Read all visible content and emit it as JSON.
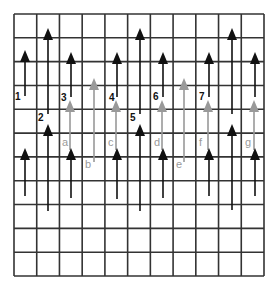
{
  "figure": {
    "colors": {
      "background": "#ffffff",
      "grid": "#333333",
      "black_arrow": "#111111",
      "gray_arrow": "#999999",
      "number_label": "#111111",
      "letter_label": "#9a9a9a"
    },
    "grid": {
      "left": 14,
      "top": 14,
      "right": 264,
      "bottom": 276,
      "columns": 11,
      "rows": 11
    },
    "black_arrows": [
      {
        "x": 25,
        "tip": 50,
        "tail": 96
      },
      {
        "x": 48,
        "tip": 28,
        "tail": 114
      },
      {
        "x": 71,
        "tip": 52,
        "tail": 97
      },
      {
        "x": 117,
        "tip": 52,
        "tail": 97
      },
      {
        "x": 140,
        "tip": 28,
        "tail": 114
      },
      {
        "x": 163,
        "tip": 52,
        "tail": 97
      },
      {
        "x": 209,
        "tip": 52,
        "tail": 97
      },
      {
        "x": 232,
        "tip": 28,
        "tail": 114
      },
      {
        "x": 255,
        "tip": 52,
        "tail": 97
      },
      {
        "x": 25,
        "tip": 148,
        "tail": 196
      },
      {
        "x": 48,
        "tip": 124,
        "tail": 211
      },
      {
        "x": 71,
        "tip": 148,
        "tail": 198
      },
      {
        "x": 117,
        "tip": 148,
        "tail": 199
      },
      {
        "x": 140,
        "tip": 124,
        "tail": 211
      },
      {
        "x": 163,
        "tip": 148,
        "tail": 198
      },
      {
        "x": 209,
        "tip": 148,
        "tail": 196
      },
      {
        "x": 232,
        "tip": 124,
        "tail": 210
      },
      {
        "x": 255,
        "tip": 148,
        "tail": 196
      }
    ],
    "gray_arrows": [
      {
        "x": 70,
        "tip": 100,
        "tail": 150
      },
      {
        "x": 94,
        "tip": 78,
        "tail": 162
      },
      {
        "x": 116,
        "tip": 100,
        "tail": 150
      },
      {
        "x": 162,
        "tip": 100,
        "tail": 150
      },
      {
        "x": 184,
        "tip": 78,
        "tail": 162
      },
      {
        "x": 208,
        "tip": 100,
        "tail": 150
      },
      {
        "x": 254,
        "tip": 100,
        "tail": 150
      }
    ],
    "number_labels": [
      {
        "text": "1",
        "x": 15,
        "y": 100
      },
      {
        "text": "2",
        "x": 38,
        "y": 121
      },
      {
        "text": "3",
        "x": 61,
        "y": 101
      },
      {
        "text": "4",
        "x": 109,
        "y": 101
      },
      {
        "text": "5",
        "x": 130,
        "y": 121
      },
      {
        "text": "6",
        "x": 153,
        "y": 100
      },
      {
        "text": "7",
        "x": 199,
        "y": 100
      }
    ],
    "letter_labels": [
      {
        "text": "a",
        "x": 62,
        "y": 146
      },
      {
        "text": "b",
        "x": 85,
        "y": 168
      },
      {
        "text": "c",
        "x": 108,
        "y": 146
      },
      {
        "text": "d",
        "x": 154,
        "y": 146
      },
      {
        "text": "e",
        "x": 176,
        "y": 168
      },
      {
        "text": "f",
        "x": 199,
        "y": 146
      },
      {
        "text": "g",
        "x": 245,
        "y": 146
      }
    ]
  }
}
